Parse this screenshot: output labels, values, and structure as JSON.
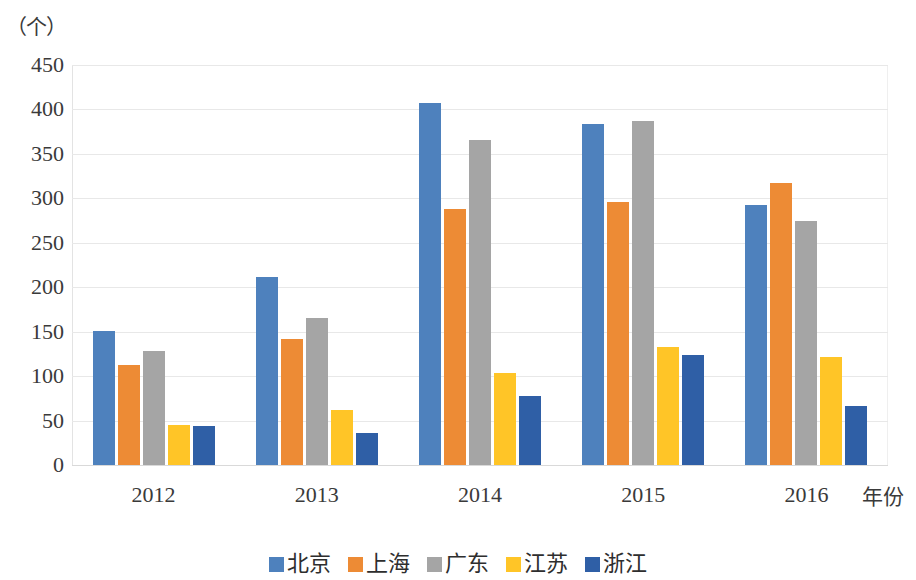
{
  "chart_data": {
    "type": "bar",
    "title": "",
    "subtitle": "",
    "xlabel": "年份",
    "ylabel": "（个）",
    "categories": [
      "2012",
      "2013",
      "2014",
      "2015",
      "2016"
    ],
    "series": [
      {
        "name": "北京",
        "color": "#4E81BD",
        "values": [
          151,
          211,
          407,
          384,
          293
        ]
      },
      {
        "name": "上海",
        "color": "#ED8B35",
        "values": [
          112,
          142,
          288,
          296,
          317
        ]
      },
      {
        "name": "广东",
        "color": "#A5A5A5",
        "values": [
          128,
          165,
          366,
          387,
          274
        ]
      },
      {
        "name": "江苏",
        "color": "#FFC527",
        "values": [
          45,
          62,
          103,
          133,
          122
        ]
      },
      {
        "name": "浙江",
        "color": "#2F5FA6",
        "values": [
          44,
          36,
          78,
          124,
          66
        ]
      }
    ],
    "ylim": [
      0,
      450
    ],
    "ytick_step": 50,
    "yticks": [
      "450",
      "400",
      "350",
      "300",
      "250",
      "200",
      "150",
      "100",
      "50",
      "0"
    ],
    "grid": true,
    "legend_position": "bottom",
    "bar_gap": "grouped"
  }
}
